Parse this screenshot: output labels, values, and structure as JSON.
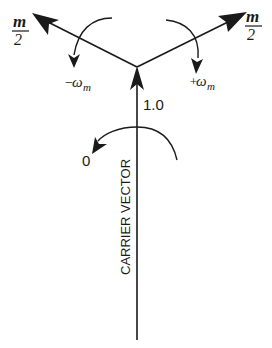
{
  "diagram": {
    "type": "phasor diagram",
    "carrier": {
      "label": "CARRIER VECTOR",
      "amplitude_label": "1.0",
      "rotation_label": "0"
    },
    "lower_sideband": {
      "amplitude_num": "m",
      "amplitude_den": "2",
      "rotation_sign": "−",
      "rotation_symbol": "ω",
      "rotation_sub": "m"
    },
    "upper_sideband": {
      "amplitude_num": "m",
      "amplitude_den": "2",
      "rotation_sign": "+",
      "rotation_symbol": "ω",
      "rotation_sub": "m"
    },
    "colors": {
      "stroke": "#1a1a1a",
      "background": "#ffffff"
    }
  }
}
